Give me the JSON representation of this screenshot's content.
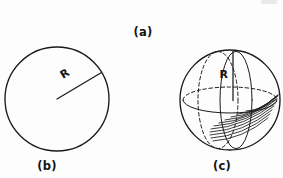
{
  "figure": {
    "background_color": "#fdfdfd",
    "ink_color": "#1a1a1a",
    "width": 283,
    "height": 178,
    "panels": [
      {
        "id": "a",
        "caption": "(a)",
        "caption_x": 143,
        "caption_y": 36,
        "content": "none-visible"
      },
      {
        "id": "b",
        "caption": "(b)",
        "caption_x": 47,
        "caption_y": 170,
        "shape": "circle",
        "center_x": 57,
        "center_y": 99,
        "radius": 52,
        "radius_label": "R",
        "radius_label_x": 63,
        "radius_label_y": 79,
        "radius_label_rotation": -32,
        "radius_line_end_x": 102,
        "radius_line_end_y": 73
      },
      {
        "id": "c",
        "caption": "(c)",
        "caption_x": 222,
        "caption_y": 170,
        "shape": "sphere",
        "center_x": 230,
        "center_y": 100,
        "radius": 50,
        "equator_rx": 47,
        "equator_ry": 13,
        "meridian_dashed_cx": 218,
        "meridian_dashed_rx": 20,
        "meridian_solid_cx": 236,
        "meridian_solid_rx": 16,
        "radius_label": "R",
        "radius_label_x": 228,
        "radius_label_y": 78,
        "radius_line_top_y": 52,
        "radius_line_bottom_y": 100,
        "shading": "curved-hatching-lower-right",
        "shading_arc_count": 11
      }
    ]
  }
}
